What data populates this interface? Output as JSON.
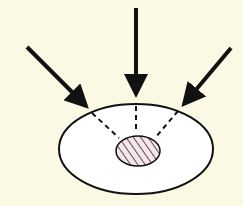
{
  "diagram": {
    "background": "#fbf8e4",
    "outer_ellipse": {
      "cx": 136,
      "cy": 149,
      "rx": 77,
      "ry": 45,
      "fill": "#ffffff",
      "stroke": "#111111"
    },
    "inner_ellipse": {
      "cx": 138,
      "cy": 151,
      "rx": 22,
      "ry": 15,
      "fill": "#f6e6ea",
      "stroke": "#111111",
      "pattern": "diagonal-hatch"
    },
    "arrows": [
      {
        "name": "left",
        "x1": 27,
        "y1": 47,
        "x2": 90,
        "y2": 110
      },
      {
        "name": "center",
        "x1": 136,
        "y1": 8,
        "x2": 136,
        "y2": 100
      },
      {
        "name": "right",
        "x1": 231,
        "y1": 48,
        "x2": 180,
        "y2": 108
      }
    ],
    "dashed_lines": [
      {
        "x1": 92,
        "y1": 113,
        "x2": 119,
        "y2": 138
      },
      {
        "x1": 136,
        "y1": 106,
        "x2": 136,
        "y2": 133
      },
      {
        "x1": 178,
        "y1": 111,
        "x2": 155,
        "y2": 138
      }
    ]
  }
}
